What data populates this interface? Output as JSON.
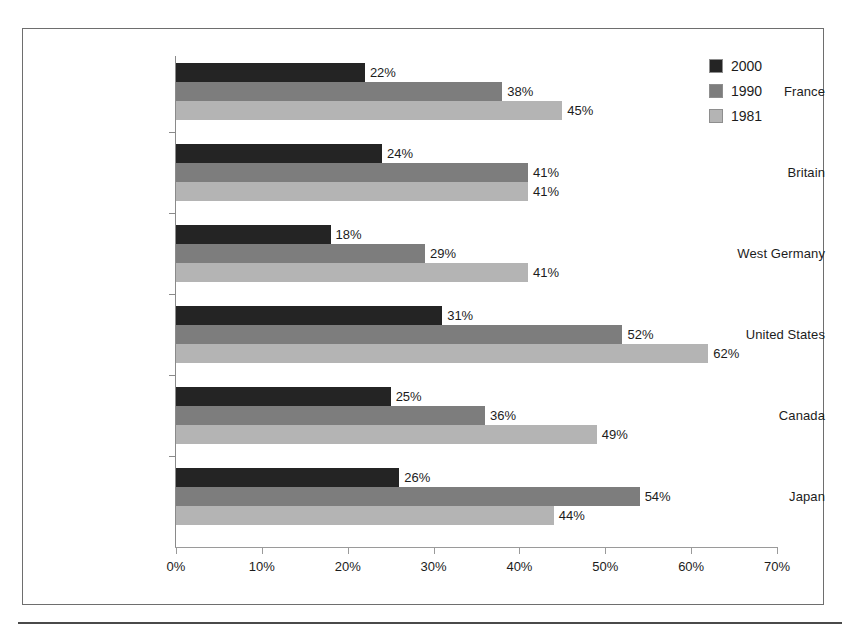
{
  "chart_data": {
    "type": "bar",
    "orientation": "horizontal",
    "title": "",
    "subtitle": "",
    "xlabel": "",
    "ylabel": "",
    "xlim": [
      0,
      70
    ],
    "xtick_labels": [
      "0%",
      "10%",
      "20%",
      "30%",
      "40%",
      "50%",
      "60%",
      "70%"
    ],
    "xtick_values": [
      0,
      10,
      20,
      30,
      40,
      50,
      60,
      70
    ],
    "grid": false,
    "legend_position": "top-right",
    "value_suffix": "%",
    "categories": [
      "France",
      "Britain",
      "West Germany",
      "United States",
      "Canada",
      "Japan"
    ],
    "series": [
      {
        "name": "2000",
        "color": "#242424",
        "values": [
          22,
          24,
          18,
          31,
          25,
          26
        ],
        "labels": [
          "22%",
          "24%",
          "18%",
          "31%",
          "25%",
          "26%"
        ]
      },
      {
        "name": "1990",
        "color": "#7d7d7d",
        "values": [
          38,
          41,
          29,
          52,
          36,
          54
        ],
        "labels": [
          "38%",
          "41%",
          "29%",
          "52%",
          "36%",
          "54%"
        ]
      },
      {
        "name": "1981",
        "color": "#b4b4b4",
        "values": [
          45,
          41,
          41,
          62,
          49,
          44
        ],
        "labels": [
          "45%",
          "41%",
          "41%",
          "62%",
          "49%",
          "44%"
        ]
      }
    ]
  },
  "legend": {
    "entries": [
      {
        "label": "2000",
        "color": "#242424"
      },
      {
        "label": "1990",
        "color": "#7d7d7d"
      },
      {
        "label": "1981",
        "color": "#b4b4b4"
      }
    ]
  },
  "axis": {
    "x_labels": [
      "0%",
      "10%",
      "20%",
      "30%",
      "40%",
      "50%",
      "60%",
      "70%"
    ],
    "y_labels": [
      "France",
      "Britain",
      "West Germany",
      "United States",
      "Canada",
      "Japan"
    ]
  },
  "colors": {
    "frame": "#6e6e6e",
    "axis": "#9a9a9a",
    "text": "#1c1c1c",
    "background": "#ffffff"
  }
}
